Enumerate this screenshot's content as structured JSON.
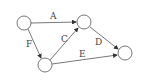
{
  "diagram": {
    "type": "directed-graph",
    "nodes": [
      {
        "id": "n1",
        "x": 24,
        "y": 23
      },
      {
        "id": "n2",
        "x": 84,
        "y": 22
      },
      {
        "id": "n3",
        "x": 45,
        "y": 65
      },
      {
        "id": "n4",
        "x": 125,
        "y": 53
      }
    ],
    "edges": [
      {
        "label": "A",
        "from": "n1",
        "to": "n2"
      },
      {
        "label": "F",
        "from": "n1",
        "to": "n3"
      },
      {
        "label": "C",
        "from": "n3",
        "to": "n2"
      },
      {
        "label": "D",
        "from": "n2",
        "to": "n4"
      },
      {
        "label": "E",
        "from": "n3",
        "to": "n4"
      }
    ],
    "colors": {
      "stroke": "#555555",
      "background": "#ffffff"
    }
  }
}
